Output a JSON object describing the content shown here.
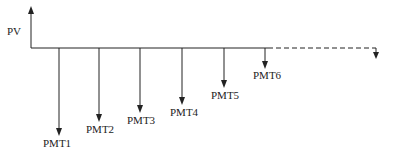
{
  "diagram": {
    "type": "cash-flow-timeline",
    "pv": {
      "label": "PV",
      "direction": "up"
    },
    "payments": [
      {
        "label": "PMT1",
        "x": 59,
        "tip_y": 135,
        "label_y": 146
      },
      {
        "label": "PMT2",
        "x": 99,
        "tip_y": 121,
        "label_y": 132
      },
      {
        "label": "PMT3",
        "x": 140,
        "tip_y": 112,
        "label_y": 123
      },
      {
        "label": "PMT4",
        "x": 182,
        "tip_y": 104,
        "label_y": 115
      },
      {
        "label": "PMT5",
        "x": 224,
        "tip_y": 87,
        "label_y": 98
      },
      {
        "label": "PMT6",
        "x": 265,
        "tip_y": 68,
        "label_y": 78
      }
    ],
    "continuation": {
      "style": "dashed",
      "arrow": "down"
    },
    "colors": {
      "line": "#222222",
      "background": "#ffffff"
    }
  }
}
